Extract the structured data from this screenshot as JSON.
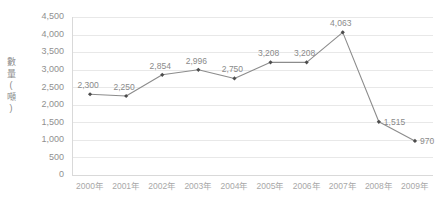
{
  "chart_data": {
    "type": "line",
    "title": "",
    "subtitle": "",
    "xlabel": "",
    "ylabel": "數量(噸)",
    "ylabel_chars": [
      "數",
      "量",
      "(",
      "噸",
      ")"
    ],
    "categories": [
      "2000年",
      "2001年",
      "2002年",
      "2003年",
      "2004年",
      "2005年",
      "2006年",
      "2007年",
      "2008年",
      "2009年"
    ],
    "values": [
      2300,
      2250,
      2854,
      2996,
      2750,
      3208,
      3208,
      4063,
      1515,
      970
    ],
    "point_labels": [
      "2,300",
      "2,250",
      "2,854",
      "2,996",
      "2,750",
      "3,208",
      "3,208",
      "4,063",
      "1,515",
      "970"
    ],
    "point_label_placement": [
      "above",
      "above",
      "above",
      "above",
      "above",
      "above",
      "above",
      "above",
      "right",
      "right"
    ],
    "ylim": [
      0,
      4500
    ],
    "ytick_values": [
      0,
      500,
      1000,
      1500,
      2000,
      2500,
      3000,
      3500,
      4000,
      4500
    ],
    "ytick_labels": [
      "0",
      "500",
      "1,000",
      "1,500",
      "2,000",
      "2,500",
      "3,000",
      "3,500",
      "4,000",
      "4,500"
    ],
    "grid": true,
    "legend": false,
    "legend_position": "none",
    "series": [
      {
        "name": "數量(噸)",
        "values": [
          2300,
          2250,
          2854,
          2996,
          2750,
          3208,
          3208,
          4063,
          1515,
          970
        ]
      }
    ],
    "colors": {
      "line": "#8c8c8c",
      "marker": "#4d4d4d",
      "grid": "#e8e8e8",
      "axis": "#d9d9d9",
      "tick_text": "#909090",
      "xtick_text": "#a8a8a8",
      "label_text": "#8a8a8a",
      "background": "#ffffff"
    }
  }
}
